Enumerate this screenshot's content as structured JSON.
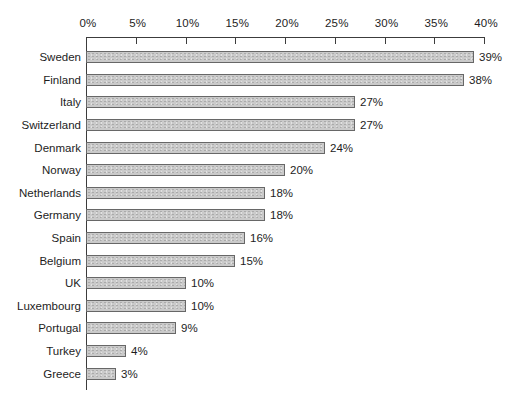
{
  "chart_data": {
    "type": "bar",
    "orientation": "horizontal",
    "title": "",
    "xlabel": "",
    "ylabel": "",
    "categories": [
      "Sweden",
      "Finland",
      "Italy",
      "Switzerland",
      "Denmark",
      "Norway",
      "Netherlands",
      "Germany",
      "Spain",
      "Belgium",
      "UK",
      "Luxembourg",
      "Portugal",
      "Turkey",
      "Greece"
    ],
    "values": [
      39,
      38,
      27,
      27,
      24,
      20,
      18,
      18,
      16,
      15,
      10,
      10,
      9,
      4,
      3
    ],
    "value_labels": [
      "39%",
      "38%",
      "27%",
      "27%",
      "24%",
      "20%",
      "18%",
      "18%",
      "16%",
      "15%",
      "10%",
      "10%",
      "9%",
      "4%",
      "3%"
    ],
    "xlim": [
      0,
      40
    ],
    "x_tick_values": [
      0,
      5,
      10,
      15,
      20,
      25,
      30,
      35,
      40
    ],
    "x_tick_labels": [
      "0%",
      "5%",
      "10%",
      "15%",
      "20%",
      "25%",
      "30%",
      "35%",
      "40%"
    ],
    "grid": false,
    "legend": "none",
    "axis_position": "top",
    "colors": {
      "bar_fill": "#cacaca",
      "bar_border": "#676767",
      "axis": "#3c3c3c",
      "text": "#1d1d1d",
      "background": "#ffffff"
    }
  }
}
